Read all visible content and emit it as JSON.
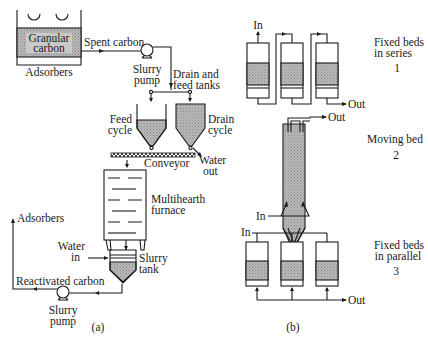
{
  "figure": {
    "panel_a": {
      "caption": "(a)",
      "adsorber": {
        "material_line1": "Granular",
        "material_line2": "carbon",
        "label": "Adsorbers"
      },
      "spent_carbon_label": "Spent carbon",
      "slurry_pump_top": {
        "line1": "Slurry",
        "line2": "pump"
      },
      "drain_feed_tanks": {
        "line1": "Drain and",
        "line2": "feed tanks"
      },
      "feed_cycle": {
        "line1": "Feed",
        "line2": "cycle"
      },
      "drain_cycle": {
        "line1": "Drain",
        "line2": "cycle"
      },
      "water_out": {
        "line1": "Water",
        "line2": "out"
      },
      "conveyor_label": "Conveyor",
      "furnace": {
        "line1": "Multihearth",
        "line2": "furnace"
      },
      "adsorbers_return_label": "Adsorbers",
      "water_in": {
        "line1": "Water",
        "line2": "in"
      },
      "slurry_tank": {
        "line1": "Slurry",
        "line2": "tank"
      },
      "reactivated_carbon_label": "Reactivated carbon",
      "slurry_pump_bottom": {
        "line1": "Slurry",
        "line2": "pump"
      }
    },
    "panel_b": {
      "caption": "(b)",
      "series": {
        "in_label": "In",
        "out_label": "Out",
        "title_line1": "Fixed beds",
        "title_line2": "in series",
        "number": "1"
      },
      "moving": {
        "in_label": "In",
        "out_label": "Out",
        "title": "Moving bed",
        "number": "2"
      },
      "parallel": {
        "in_label": "In",
        "out_label": "Out",
        "title_line1": "Fixed beds",
        "title_line2": "in parallel",
        "number": "3"
      }
    }
  }
}
